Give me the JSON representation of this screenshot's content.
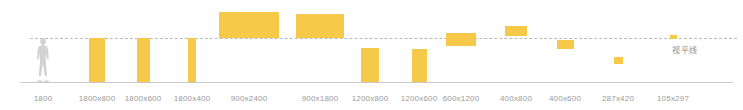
{
  "colors": {
    "bar": "#f7c948",
    "horizon_line": "#b9b9b9",
    "ground_line": "#c9c9c9",
    "label_text": "#9a9a9a",
    "horizon_label_text": "#8d8d8d",
    "figure": "#d2d2d2",
    "background": "#ffffff"
  },
  "horizon": {
    "label": "视平线",
    "y": 38
  },
  "ground": {
    "y": 82
  },
  "figure": {
    "name": "human-scale-reference",
    "height_mm": "1800"
  },
  "chart_data": {
    "type": "bar",
    "title": "",
    "subtitle": "",
    "xlabel": "",
    "ylabel": "",
    "grid": false,
    "legend": "none",
    "annotations": [
      "视平线"
    ],
    "categories": [
      "1800",
      "1800x800",
      "1800x600",
      "1800x400",
      "900x2400",
      "900x1800",
      "1200x800",
      "1200x600",
      "600x1200",
      "400x800",
      "400x600",
      "287x420",
      "105x297"
    ],
    "bars": [
      {
        "label": "1800",
        "center_x": 43,
        "width": 0,
        "top": 0,
        "height": 0,
        "is_figure": true
      },
      {
        "label": "1800x800",
        "center_x": 97,
        "width": 16,
        "top": 38,
        "height": 44,
        "is_figure": false
      },
      {
        "label": "1800x600",
        "center_x": 143,
        "width": 13,
        "top": 38,
        "height": 44,
        "is_figure": false
      },
      {
        "label": "1800x400",
        "center_x": 192,
        "width": 8,
        "top": 38,
        "height": 44,
        "is_figure": false
      },
      {
        "label": "900x2400",
        "center_x": 249,
        "width": 60,
        "top": 12,
        "height": 26,
        "is_figure": false
      },
      {
        "label": "900x1800",
        "center_x": 320,
        "width": 48,
        "top": 14,
        "height": 24,
        "is_figure": false
      },
      {
        "label": "1200x800",
        "center_x": 370,
        "width": 18,
        "top": 48,
        "height": 34,
        "is_figure": false
      },
      {
        "label": "1200x600",
        "center_x": 419,
        "width": 15,
        "top": 49,
        "height": 33,
        "is_figure": false
      },
      {
        "label": "600x1200",
        "center_x": 461,
        "width": 30,
        "top": 33,
        "height": 13,
        "is_figure": false
      },
      {
        "label": "400x800",
        "center_x": 516,
        "width": 22,
        "top": 26,
        "height": 10,
        "is_figure": false
      },
      {
        "label": "400x600",
        "center_x": 565,
        "width": 17,
        "top": 40,
        "height": 9,
        "is_figure": false
      },
      {
        "label": "287x420",
        "center_x": 618,
        "width": 9,
        "top": 57,
        "height": 7,
        "is_figure": false
      },
      {
        "label": "105x297",
        "center_x": 673,
        "width": 7,
        "top": 35,
        "height": 4,
        "is_figure": false
      }
    ],
    "label_positions": [
      43,
      97,
      143,
      192,
      249,
      320,
      370,
      419,
      461,
      516,
      565,
      618,
      673
    ]
  }
}
